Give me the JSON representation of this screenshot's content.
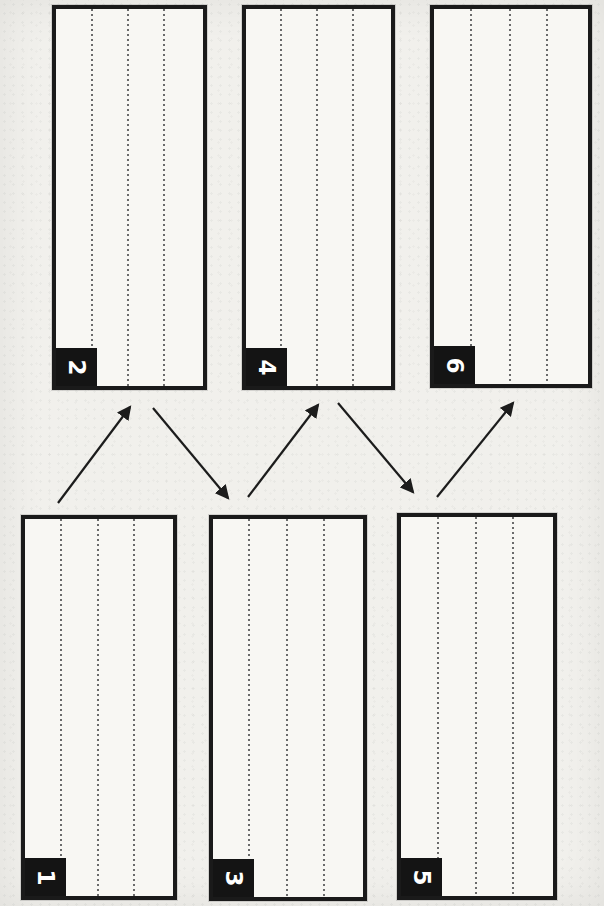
{
  "page": {
    "width": 604,
    "height": 906,
    "background": "#f1f0ec",
    "panel_fill": "#f8f7f3",
    "border_color": "#1a1a1a",
    "badge_bg": "#141414",
    "badge_text_color": "#ffffff",
    "ruled_line_color": "#6b6b6b",
    "arrow_color": "#1c1c1c",
    "text_rotation_deg": 90
  },
  "panels": [
    {
      "label": "1",
      "x": 21,
      "y": 515,
      "w": 156,
      "h": 385
    },
    {
      "label": "2",
      "x": 52,
      "y": 5,
      "w": 155,
      "h": 385
    },
    {
      "label": "3",
      "x": 209,
      "y": 515,
      "w": 158,
      "h": 386
    },
    {
      "label": "4",
      "x": 242,
      "y": 5,
      "w": 153,
      "h": 385
    },
    {
      "label": "5",
      "x": 397,
      "y": 513,
      "w": 160,
      "h": 387
    },
    {
      "label": "6",
      "x": 430,
      "y": 5,
      "w": 162,
      "h": 383
    }
  ],
  "ruled_line_positions_pct": [
    23.5,
    48.5,
    73
  ],
  "arrows": [
    {
      "from": "1",
      "to": "2",
      "x1": 58,
      "y1": 503,
      "x2": 130,
      "y2": 407
    },
    {
      "from": "2",
      "to": "3",
      "x1": 153,
      "y1": 408,
      "x2": 228,
      "y2": 498
    },
    {
      "from": "3",
      "to": "4",
      "x1": 248,
      "y1": 497,
      "x2": 318,
      "y2": 405
    },
    {
      "from": "4",
      "to": "5",
      "x1": 338,
      "y1": 403,
      "x2": 413,
      "y2": 492
    },
    {
      "from": "5",
      "to": "6",
      "x1": 437,
      "y1": 497,
      "x2": 513,
      "y2": 403
    }
  ]
}
